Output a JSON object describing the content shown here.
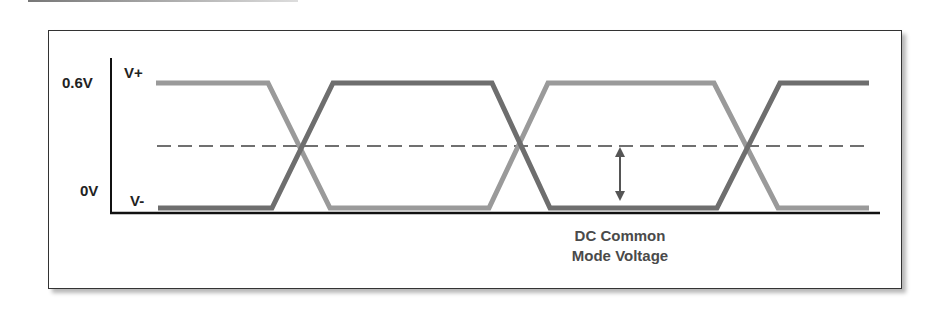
{
  "diagram": {
    "type": "differential-signal-waveform",
    "y_axis_labels": {
      "top": "0.6V",
      "bottom": "0V"
    },
    "trace_labels": {
      "high": "V+",
      "low": "V-"
    },
    "caption_line1": "DC Common",
    "caption_line2": "Mode Voltage",
    "colors": {
      "trace_light": "#9a9a9a",
      "trace_dark": "#6e6e6e",
      "dashed": "#707070",
      "axis": "#111111",
      "caption": "#4a4a4a"
    },
    "levels": {
      "high_y": 83,
      "low_y": 208,
      "common_mode_y": 146
    },
    "crossings_x": [
      301,
      519,
      747
    ]
  }
}
